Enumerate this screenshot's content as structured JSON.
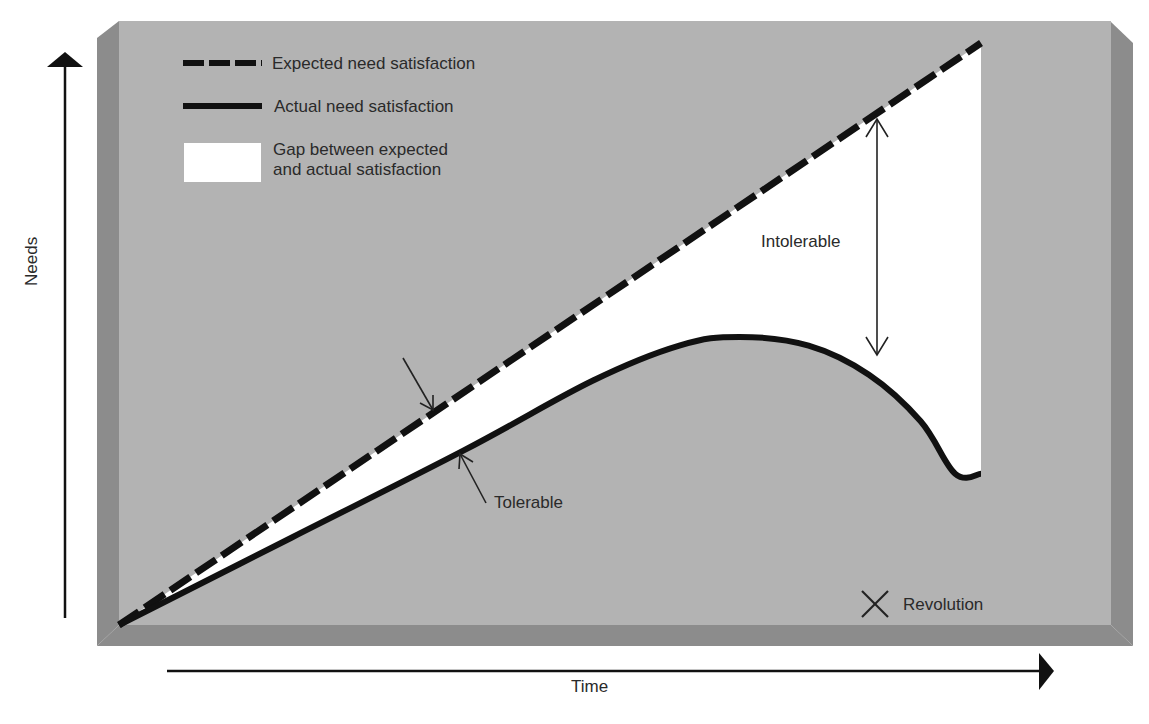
{
  "chart_data": {
    "type": "line",
    "title": "",
    "xlabel": "Time",
    "ylabel": "Needs",
    "x_range": [
      0,
      100
    ],
    "y_range": [
      0,
      100
    ],
    "grid": false,
    "legend_placement": "top-left",
    "series": [
      {
        "name": "Expected need satisfaction",
        "style": "dashed",
        "x": [
          0,
          100
        ],
        "y": [
          0,
          100
        ]
      },
      {
        "name": "Actual need satisfaction",
        "style": "solid",
        "x": [
          0,
          20,
          40,
          55,
          65,
          72,
          80,
          87,
          93,
          97,
          100
        ],
        "y": [
          0,
          15,
          30,
          42,
          48,
          49.5,
          48,
          43,
          35,
          26,
          26
        ]
      }
    ],
    "gap_area": {
      "name": "Gap between expected and actual satisfaction",
      "color": "#ffffff"
    },
    "annotations": [
      {
        "text": "Tolerable",
        "type": "arrow-pair"
      },
      {
        "text": "Intolerable",
        "type": "double-arrow"
      },
      {
        "text": "Revolution",
        "type": "marker-x"
      }
    ]
  },
  "legend": {
    "items": [
      {
        "label": "Expected need satisfaction",
        "symbol": "dashed-line"
      },
      {
        "label": "Actual need satisfaction",
        "symbol": "solid-line"
      },
      {
        "label_line1": "Gap between expected",
        "label_line2": "and actual satisfaction",
        "symbol": "white-box"
      }
    ]
  },
  "labels": {
    "tolerable": "Tolerable",
    "intolerable": "Intolerable",
    "revolution": "Revolution",
    "x_axis": "Time",
    "y_axis": "Needs"
  },
  "colors": {
    "panel": "#b3b3b3",
    "bevel": "#8c8c8c",
    "line": "#111111",
    "gap": "#ffffff",
    "text": "#2a2a2a"
  }
}
